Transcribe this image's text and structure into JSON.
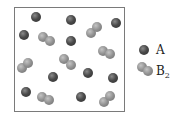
{
  "diagram": {
    "box": {
      "x": 14,
      "y": 7,
      "w": 111,
      "h": 105
    },
    "atoms_A": [
      [
        36,
        17
      ],
      [
        71,
        20
      ],
      [
        116,
        23
      ],
      [
        24,
        35
      ],
      [
        71,
        41
      ],
      [
        53,
        77
      ],
      [
        88,
        73
      ],
      [
        113,
        78
      ],
      [
        26,
        92
      ],
      [
        81,
        97
      ]
    ],
    "molecules_B2": [
      [
        [
          43,
          37
        ],
        [
          50,
          41
        ]
      ],
      [
        [
          91,
          33
        ],
        [
          97,
          27
        ]
      ],
      [
        [
          103,
          51
        ],
        [
          110,
          54
        ]
      ],
      [
        [
          22,
          68
        ],
        [
          28,
          63
        ]
      ],
      [
        [
          64,
          59
        ],
        [
          71,
          65
        ]
      ],
      [
        [
          42,
          97
        ],
        [
          49,
          100
        ]
      ],
      [
        [
          104,
          102
        ],
        [
          110,
          96
        ]
      ]
    ],
    "legend": {
      "A": {
        "label": "A",
        "atom": [
          144,
          50
        ]
      },
      "B2": {
        "label": "B",
        "subscript": "2",
        "atoms": [
          [
            142,
            67
          ],
          [
            148,
            71
          ]
        ]
      }
    },
    "colors": {
      "A": "#4a4a4a",
      "B": "#909090",
      "border": "#7a7a7a"
    }
  }
}
